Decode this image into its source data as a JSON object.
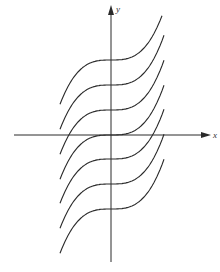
{
  "figure": {
    "type": "family-of-curves",
    "x_axis_label": "x",
    "y_axis_label": "y",
    "curve_color": "#2a2a2a",
    "axis_color": "#2a2a2a",
    "curve_count": 7,
    "curve_offsets_px": [
      -74,
      -49,
      -24,
      0,
      25,
      50,
      75
    ]
  },
  "chart_data": {
    "type": "line",
    "title": "",
    "xlabel": "x",
    "ylabel": "y",
    "grid": false,
    "legend": "none",
    "series": [
      {
        "name": "C = 3",
        "intercept": 3
      },
      {
        "name": "C = 2",
        "intercept": 2
      },
      {
        "name": "C = 1",
        "intercept": 1
      },
      {
        "name": "C = 0",
        "intercept": 0
      },
      {
        "name": "C = -1",
        "intercept": -1
      },
      {
        "name": "C = -2",
        "intercept": -2
      },
      {
        "name": "C = -3",
        "intercept": -3
      }
    ]
  }
}
